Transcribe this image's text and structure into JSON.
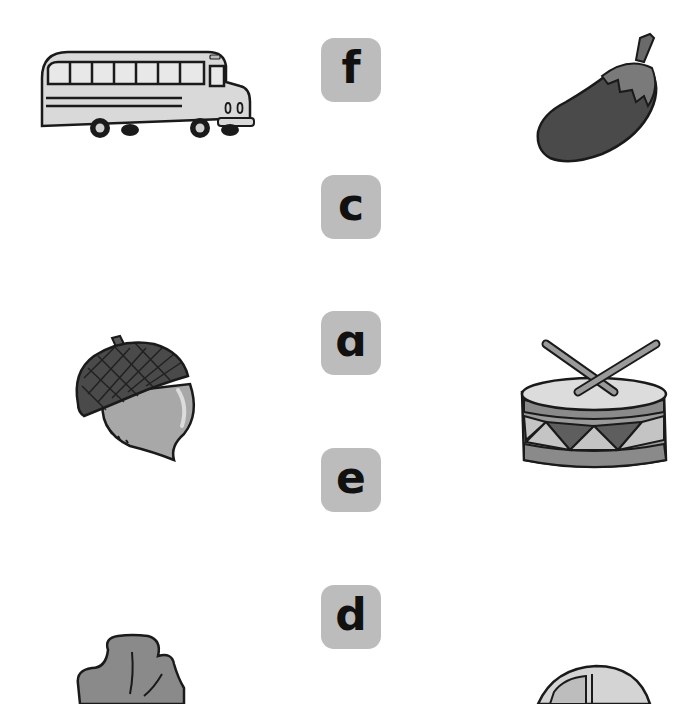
{
  "worksheet": {
    "type": "letter-picture matching",
    "left_pictures": [
      {
        "id": "bus",
        "label": "bus"
      },
      {
        "id": "acorn",
        "label": "acorn"
      },
      {
        "id": "clover",
        "label": "clover (partially visible)"
      }
    ],
    "letters": [
      {
        "letter": "f"
      },
      {
        "letter": "c"
      },
      {
        "letter": "ɑ"
      },
      {
        "letter": "e"
      },
      {
        "letter": "d"
      }
    ],
    "right_pictures": [
      {
        "id": "eggplant",
        "label": "eggplant"
      },
      {
        "id": "drum",
        "label": "drum"
      },
      {
        "id": "car",
        "label": "car (partially visible)"
      }
    ]
  },
  "colors": {
    "tile_bg": "#bcbcbc",
    "letter": "#111111",
    "outline": "#1a1a1a",
    "light_gray": "#d6d6d6",
    "mid_gray": "#9a9a9a",
    "dark_gray": "#5a5a5a"
  }
}
